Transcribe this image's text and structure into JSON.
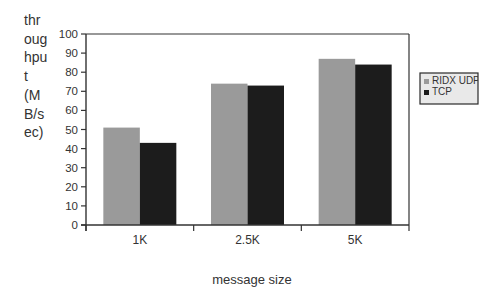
{
  "chart_data": {
    "type": "bar",
    "title": "",
    "xlabel": "message size",
    "ylabel": "throughput (MB/sec)",
    "ylabel_lines": [
      "thr",
      "oug",
      "hpu",
      "t",
      "(M",
      "B/s",
      "ec)"
    ],
    "categories": [
      "1K",
      "2.5K",
      "5K"
    ],
    "series": [
      {
        "name": "RIDX UDP",
        "color": "#9a9a9a",
        "values": [
          51,
          74,
          87
        ]
      },
      {
        "name": "TCP",
        "color": "#1c1c1c",
        "values": [
          43,
          73,
          84
        ]
      }
    ],
    "ylim": [
      0,
      100
    ],
    "yticks": [
      0,
      10,
      20,
      30,
      40,
      50,
      60,
      70,
      80,
      90,
      100
    ],
    "grid": false,
    "legend_position": "right"
  },
  "legend": {
    "items": [
      {
        "label": "RIDX UDP",
        "color": "#9a9a9a"
      },
      {
        "label": "TCP",
        "color": "#1c1c1c"
      }
    ]
  }
}
